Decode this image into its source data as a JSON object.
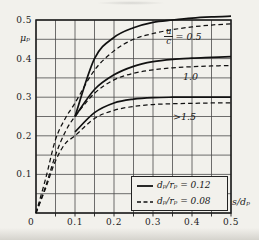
{
  "figure": {
    "y_axis_title": "μₚ",
    "x_axis_title": "s/dₚ",
    "origin_label": "0"
  },
  "curve_labels": {
    "uc_numerator": "u",
    "uc_denominator": "c",
    "uc_value": "= 0.5",
    "mid": "1.0",
    "low": ">1.5"
  },
  "legend": {
    "solid_label": "dₚ/rₚ = 0.12",
    "dashed_label": "dₚ/rₚ = 0.08"
  },
  "colors": {
    "paper": "#f2f1ec",
    "ink": "#1a1a1a",
    "grid": "#4a4a4a"
  },
  "chart_data": {
    "type": "line",
    "title": "",
    "xlabel": "s/dₚ",
    "ylabel": "μₚ",
    "xlim": [
      0,
      0.5
    ],
    "ylim": [
      0,
      0.5
    ],
    "grid": true,
    "grid_step": 0.05,
    "xticks": [
      0,
      0.1,
      0.2,
      0.3,
      0.4,
      0.5
    ],
    "yticks": [
      0.1,
      0.2,
      0.3,
      0.4,
      0.5
    ],
    "xtick_labels": [
      "0",
      "0.1",
      "0.2",
      "0.3",
      "0.4",
      "0.5"
    ],
    "ytick_labels": [
      "0.1",
      "0.2",
      "0.3",
      "0.4",
      "0.5"
    ],
    "legend_position": "lower right",
    "series": [
      {
        "name": "u/c=0.5, dp/rp=0.12",
        "style": "solid",
        "x": [
          0.1,
          0.15,
          0.2,
          0.25,
          0.3,
          0.35,
          0.4,
          0.45,
          0.5
        ],
        "y": [
          0.25,
          0.4,
          0.455,
          0.48,
          0.494,
          0.5,
          0.505,
          0.508,
          0.51
        ]
      },
      {
        "name": "u/c=1.0, dp/rp=0.12",
        "style": "solid",
        "x": [
          0.1,
          0.15,
          0.2,
          0.25,
          0.3,
          0.35,
          0.4,
          0.45,
          0.5
        ],
        "y": [
          0.25,
          0.32,
          0.358,
          0.38,
          0.392,
          0.398,
          0.401,
          0.403,
          0.405
        ]
      },
      {
        "name": "u/c>1.5, dp/rp=0.12",
        "style": "solid",
        "x": [
          0.1,
          0.15,
          0.2,
          0.25,
          0.3,
          0.35,
          0.4,
          0.45,
          0.5
        ],
        "y": [
          0.21,
          0.26,
          0.285,
          0.295,
          0.299,
          0.3,
          0.3,
          0.3,
          0.3
        ]
      },
      {
        "name": "u/c=0.5, dp/rp=0.08",
        "style": "dashed",
        "x": [
          0,
          0.025,
          0.05,
          0.075,
          0.1,
          0.15,
          0.2,
          0.25,
          0.3,
          0.35,
          0.4,
          0.45,
          0.5
        ],
        "y": [
          0,
          0.09,
          0.19,
          0.245,
          0.285,
          0.37,
          0.42,
          0.45,
          0.465,
          0.475,
          0.482,
          0.487,
          0.49
        ]
      },
      {
        "name": "u/c=1.0, dp/rp=0.08",
        "style": "dashed",
        "x": [
          0,
          0.025,
          0.05,
          0.075,
          0.1,
          0.15,
          0.2,
          0.25,
          0.3,
          0.35,
          0.4,
          0.45,
          0.5
        ],
        "y": [
          0,
          0.07,
          0.15,
          0.21,
          0.25,
          0.31,
          0.345,
          0.362,
          0.371,
          0.376,
          0.379,
          0.381,
          0.382
        ]
      },
      {
        "name": "u/c>1.5, dp/rp=0.08",
        "style": "dashed",
        "x": [
          0,
          0.025,
          0.05,
          0.075,
          0.1,
          0.15,
          0.2,
          0.25,
          0.3,
          0.35,
          0.4,
          0.45,
          0.5
        ],
        "y": [
          0,
          0.065,
          0.135,
          0.18,
          0.2,
          0.245,
          0.266,
          0.276,
          0.281,
          0.283,
          0.284,
          0.285,
          0.285
        ]
      }
    ]
  }
}
